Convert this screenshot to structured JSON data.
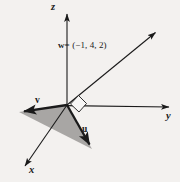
{
  "figure": {
    "background_color": "#f3f1ef",
    "stroke_color": "#1a1a1a",
    "fill_color": "#a8a6a4",
    "right_angle_fill": "#f7f6f5",
    "width": 180,
    "height": 182
  },
  "axes": {
    "z": {
      "label": "z",
      "origin": [
        67,
        105
      ],
      "tip": [
        67,
        10
      ]
    },
    "y": {
      "label": "y",
      "origin": [
        67,
        105
      ],
      "tip": [
        173,
        107
      ]
    },
    "x": {
      "label": "x",
      "origin": [
        67,
        105
      ],
      "tip": [
        22,
        170
      ]
    }
  },
  "vectors": {
    "w": {
      "label": "w",
      "equation": "= (−1, 4, 2)",
      "components": [
        -1,
        4,
        2
      ],
      "origin": [
        67,
        105
      ],
      "tip": [
        159,
        29
      ]
    },
    "v": {
      "label": "v",
      "origin": [
        67,
        105
      ],
      "tip": [
        19,
        112
      ]
    },
    "u": {
      "label": "u",
      "origin": [
        67,
        105
      ],
      "tip": [
        92,
        149
      ]
    }
  },
  "annotations": {
    "right_angle": "right-angle-marker",
    "triangle": "shaded-triangle-ouv"
  }
}
